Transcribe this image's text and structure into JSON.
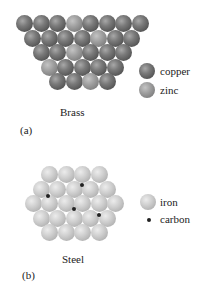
{
  "panels": [
    {
      "id": "a",
      "panel_label": "(a)",
      "title": "Brass",
      "legend": [
        {
          "name": "copper",
          "label": "copper",
          "color": "#666666"
        },
        {
          "name": "zinc",
          "label": "zinc",
          "color": "#9a9a9a"
        }
      ],
      "rows": [
        [
          "copper",
          "copper",
          "copper",
          "zinc",
          "copper",
          "copper",
          "copper",
          "copper"
        ],
        [
          "copper",
          "copper",
          "copper",
          "copper",
          "zinc",
          "copper",
          "copper"
        ],
        [
          "copper",
          "copper",
          "zinc",
          "copper",
          "copper",
          "copper"
        ],
        [
          "zinc",
          "copper",
          "copper",
          "copper",
          "copper"
        ],
        [
          "copper",
          "copper",
          "zinc",
          "copper"
        ]
      ]
    },
    {
      "id": "b",
      "panel_label": "(b)",
      "title": "Steel",
      "legend": [
        {
          "name": "iron",
          "label": "iron",
          "color": "#c8c8c8"
        },
        {
          "name": "carbon",
          "label": "carbon",
          "color": "#222222"
        }
      ],
      "rows": [
        [
          "iron",
          "iron",
          "iron",
          "iron"
        ],
        [
          "iron",
          "iron",
          "iron",
          "iron",
          "iron"
        ],
        [
          "iron",
          "iron",
          "iron",
          "iron",
          "iron",
          "iron"
        ],
        [
          "iron",
          "iron",
          "iron",
          "iron",
          "iron"
        ],
        [
          "iron",
          "iron",
          "iron",
          "iron"
        ]
      ],
      "carbon_count": 4
    }
  ]
}
